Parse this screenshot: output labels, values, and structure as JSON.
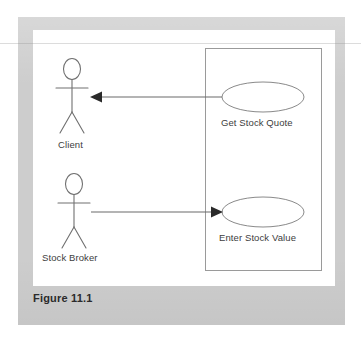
{
  "figure": {
    "caption": "Figure 11.1",
    "diagram_type": "UML Use Case Diagram"
  },
  "colors": {
    "mat_gray": "#cdcdcd",
    "panel_white": "#ffffff",
    "line_gray": "#6a6a6a",
    "ellipse_outline": "#8a8a8a",
    "boundary_outline": "#9a9a9a",
    "arrow_fill": "#2a2a2a",
    "label_text": "#3d3d3d",
    "caption_text": "#2b2b2b"
  },
  "actors": [
    {
      "id": "client",
      "label": "Client"
    },
    {
      "id": "stock-broker",
      "label": "Stock Broker"
    }
  ],
  "use_cases": [
    {
      "id": "get-stock-quote",
      "label": "Get Stock Quote"
    },
    {
      "id": "enter-stock-value",
      "label": "Enter Stock Value"
    }
  ],
  "associations": [
    {
      "id": "get-quote-to-client",
      "from": "Get Stock Quote",
      "to": "Client",
      "arrow_direction": "left"
    },
    {
      "id": "stock-broker-to-enter-value",
      "from": "Stock Broker",
      "to": "Enter Stock Value",
      "arrow_direction": "right"
    }
  ],
  "system_boundary": {
    "label": ""
  }
}
